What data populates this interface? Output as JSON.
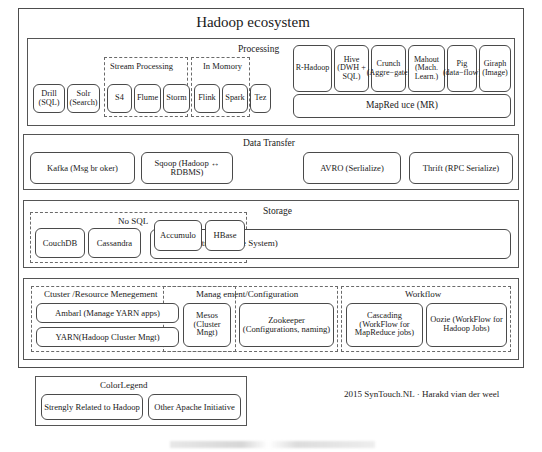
{
  "diagram": {
    "title": "Hadoop ecosystem",
    "credit": "2015 SynTouch.NL · Harakd vian der weel"
  },
  "processing": {
    "band_title": "Processing",
    "groups": {
      "stream": "Stream Processing",
      "in_memory": "In Momory"
    },
    "left_boxes": [
      {
        "id": "drill",
        "label": "Drill (SQL)"
      },
      {
        "id": "solr",
        "label": "Solr (Search)"
      },
      {
        "id": "s4",
        "label": "S4"
      },
      {
        "id": "flume",
        "label": "Flume"
      },
      {
        "id": "storm",
        "label": "Storm"
      },
      {
        "id": "flink",
        "label": "Flink"
      },
      {
        "id": "spark",
        "label": "Spark"
      },
      {
        "id": "tez",
        "label": "Tez"
      }
    ],
    "right_boxes": [
      {
        "id": "r-hadoop",
        "label": "R-Hadoop"
      },
      {
        "id": "hive",
        "label": "Hive (DWH + SQL)"
      },
      {
        "id": "crunch",
        "label": "Crunch (Aggre−gate)"
      },
      {
        "id": "mahout",
        "label": "Mahout (Mach. Learn.)"
      },
      {
        "id": "pig",
        "label": "Pig (data−flow)"
      },
      {
        "id": "giraph",
        "label": "Giraph (Image)"
      }
    ],
    "mapreduce": "MapRed uce (MR)"
  },
  "data_transfer": {
    "band_title": "Data Transfer",
    "boxes": [
      {
        "id": "kafka",
        "label": "Kafka (Msg br oker)"
      },
      {
        "id": "sqoop",
        "label": "Sqoop (Hadoop ↔ RDBMS)"
      },
      {
        "id": "avro",
        "label": "AVRO (Serlialize)"
      },
      {
        "id": "thrift",
        "label": "Thrift (RPC Serialize)"
      }
    ]
  },
  "storage": {
    "band_title": "Storage",
    "nosql_group": "No SQL",
    "boxes": [
      {
        "id": "couchdb",
        "label": "CouchDB"
      },
      {
        "id": "cassandra",
        "label": "Cassandra"
      },
      {
        "id": "accumulo",
        "label": "Accumulo"
      },
      {
        "id": "hbase",
        "label": "HBase"
      }
    ],
    "hdfs": "HDFS (Distributed File System)"
  },
  "cluster": {
    "group_cluster": "Ctuster /Resource Menegement",
    "group_management": "Manag ement/Configuration",
    "group_workflow": "Workflow",
    "boxes": [
      {
        "id": "ambari",
        "label": "Ambarl (Manage YARN apps)"
      },
      {
        "id": "yarn",
        "label": "YARN(Hadoop Cluster Mngt)"
      },
      {
        "id": "mesos",
        "label": "Mesos (Cluster Mngt)"
      },
      {
        "id": "zookeeper",
        "label": "Zookeeper (Configurations, naming)"
      },
      {
        "id": "cascading",
        "label": "Cascading (WorkFlow for MapReduce jobs)"
      },
      {
        "id": "oozie",
        "label": "Oozie (WorkFlow for Hadoop Jobs)"
      }
    ]
  },
  "legend": {
    "title": "ColorLegend",
    "items": [
      {
        "id": "strongly-related",
        "label": "Strengly Related to Hadoop"
      },
      {
        "id": "other-apache",
        "label": "Other Apache Initiative"
      }
    ]
  }
}
